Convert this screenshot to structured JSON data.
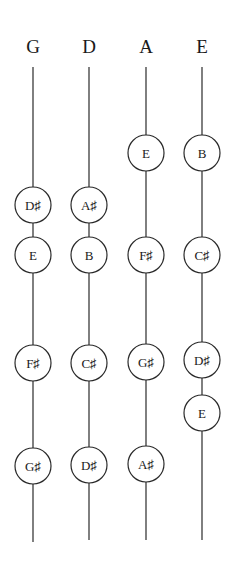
{
  "diagram": {
    "strings": [
      {
        "name": "G",
        "x": 33,
        "line_top": 67,
        "line_bottom": 542,
        "notes": [
          {
            "label": "D♯",
            "y": 205
          },
          {
            "label": "E",
            "y": 255
          },
          {
            "label": "F♯",
            "y": 363
          },
          {
            "label": "G♯",
            "y": 466
          }
        ]
      },
      {
        "name": "D",
        "x": 89,
        "line_top": 67,
        "line_bottom": 540,
        "notes": [
          {
            "label": "A♯",
            "y": 205
          },
          {
            "label": "B",
            "y": 255
          },
          {
            "label": "C♯",
            "y": 363
          },
          {
            "label": "D♯",
            "y": 465
          }
        ]
      },
      {
        "name": "A",
        "x": 146,
        "line_top": 67,
        "line_bottom": 540,
        "notes": [
          {
            "label": "E",
            "y": 153
          },
          {
            "label": "F♯",
            "y": 255
          },
          {
            "label": "G♯",
            "y": 362
          },
          {
            "label": "A♯",
            "y": 464
          }
        ]
      },
      {
        "name": "E",
        "x": 202,
        "line_top": 67,
        "line_bottom": 540,
        "notes": [
          {
            "label": "B",
            "y": 153
          },
          {
            "label": "C♯",
            "y": 255
          },
          {
            "label": "D♯",
            "y": 360
          },
          {
            "label": "E",
            "y": 413
          }
        ]
      }
    ],
    "label_y": 53,
    "note_radius": 18,
    "colors": {
      "ink": "#1a1a1a",
      "background": "#ffffff"
    }
  }
}
